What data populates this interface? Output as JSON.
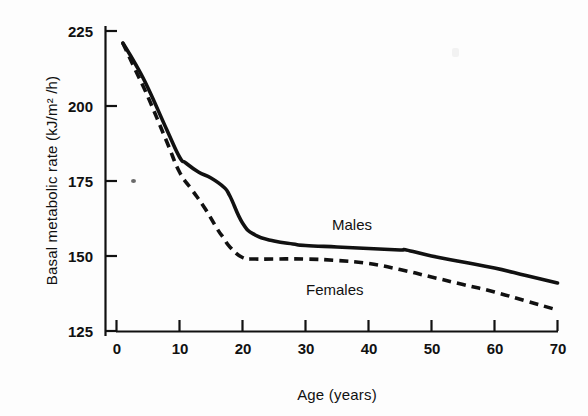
{
  "figure": {
    "background_color": "#fdfdfd",
    "ink_color": "#111111"
  },
  "chart_data": {
    "type": "line",
    "title": "",
    "xlabel": "Age (years)",
    "ylabel": "Basal metabolic rate (kJ/m² /h)",
    "xlim": [
      0,
      70
    ],
    "ylim": [
      125,
      225
    ],
    "xticks": [
      0,
      10,
      20,
      30,
      40,
      50,
      60,
      70
    ],
    "yticks": [
      125,
      150,
      175,
      200,
      225
    ],
    "xtick_labels": [
      "0",
      "10",
      "20",
      "30",
      "40",
      "50",
      "60",
      "70"
    ],
    "ytick_labels": [
      "125",
      "150",
      "175",
      "200",
      "225"
    ],
    "grid": false,
    "legend_position": "inline-annotations",
    "series": [
      {
        "name": "Males",
        "style": "solid",
        "color": "#111111",
        "annotation": "Males",
        "x": [
          1,
          3,
          5,
          8,
          10,
          11,
          13,
          15,
          17,
          18,
          20,
          22,
          25,
          28,
          30,
          35,
          40,
          45,
          46,
          50,
          55,
          60,
          65,
          70
        ],
        "y": [
          221,
          214,
          206,
          192,
          183,
          181,
          178,
          176,
          173,
          170,
          161,
          157,
          155,
          154,
          153.5,
          153,
          152.5,
          152,
          152,
          150,
          148,
          146,
          143.5,
          141
        ]
      },
      {
        "name": "Females",
        "style": "dashed",
        "color": "#111111",
        "annotation": "Females",
        "x": [
          1,
          3,
          5,
          8,
          10,
          12,
          14,
          16,
          17,
          18,
          20,
          22,
          25,
          30,
          35,
          40,
          45,
          50,
          55,
          60,
          65,
          70
        ],
        "y": [
          221,
          212,
          203,
          188,
          178,
          172,
          166,
          159,
          156,
          153,
          149.5,
          149,
          149,
          149,
          148.5,
          147.5,
          145.5,
          143,
          140.5,
          138,
          135,
          132
        ]
      }
    ],
    "annotations": [
      {
        "text": "Males",
        "x": 34.5,
        "y": 157
      },
      {
        "text": "Females",
        "x": 30.5,
        "y": 139.5
      }
    ]
  }
}
